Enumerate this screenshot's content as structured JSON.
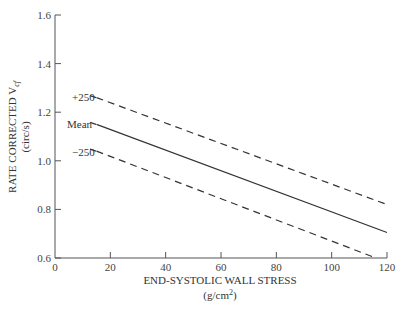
{
  "chart_data": {
    "type": "line",
    "title": "",
    "xlabel": "END-SYSTOLIC WALL STRESS",
    "xlabel_units": "(g/cm",
    "xlabel_units_sup": "2",
    "xlabel_units_close": ")",
    "ylabel": "RATE CORRECTED V",
    "ylabel_sub": "cf",
    "ylabel_units": "(circ/s)",
    "xlim": [
      0,
      120
    ],
    "ylim": [
      0.6,
      1.6
    ],
    "xticks": [
      "0",
      "20",
      "40",
      "60",
      "80",
      "100",
      "120"
    ],
    "yticks": [
      "0.6",
      "0.8",
      "1.0",
      "1.2",
      "1.4",
      "1.6"
    ],
    "grid": false,
    "series": [
      {
        "name": "+250",
        "style": "dashed",
        "x": [
          15,
          120
        ],
        "values": [
          1.26,
          0.82
        ]
      },
      {
        "name": "Mean",
        "style": "solid",
        "x": [
          15,
          120
        ],
        "values": [
          1.15,
          0.705
        ]
      },
      {
        "name": "-250",
        "style": "dashed",
        "x": [
          15,
          116
        ],
        "values": [
          1.04,
          0.6
        ]
      }
    ],
    "annotations": [
      "+250",
      "Mean",
      "−250"
    ]
  }
}
